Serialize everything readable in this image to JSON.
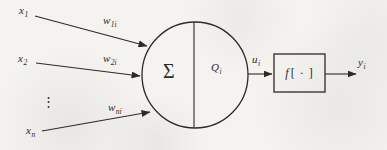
{
  "figure": {
    "inputs": [
      {
        "base": "x",
        "sub": "1"
      },
      {
        "base": "x",
        "sub": "2"
      },
      {
        "base": "x",
        "sub": "n"
      }
    ],
    "ellipsis": "⋮",
    "weights": [
      {
        "base": "w",
        "sub": "1i"
      },
      {
        "base": "w",
        "sub": "2i"
      },
      {
        "base": "w",
        "sub": "ni"
      }
    ],
    "soma": {
      "summation": "Σ",
      "threshold": {
        "base": "Q",
        "sub": "i"
      }
    },
    "activation": {
      "function": "f",
      "argument": "[ · ]"
    },
    "signals": {
      "net": {
        "base": "u",
        "sub": "i"
      },
      "output": {
        "base": "y",
        "sub": "i"
      }
    }
  },
  "colors": {
    "ink": "#2b2a28",
    "background": "#f4f3f0"
  }
}
